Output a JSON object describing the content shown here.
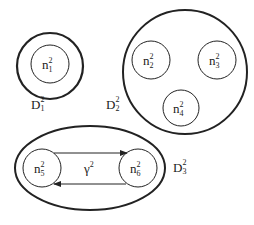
{
  "diagram": {
    "stroke_color": "#222222",
    "background": "#ffffff",
    "domains": [
      {
        "id": "D1",
        "label": {
          "base": "D",
          "sup": "2",
          "sub": "1"
        },
        "shape": "circle",
        "nodes": [
          {
            "id": "n1",
            "label": {
              "base": "n",
              "sup": "2",
              "sub": "1"
            }
          }
        ]
      },
      {
        "id": "D2",
        "label": {
          "base": "D",
          "sup": "2",
          "sub": "2"
        },
        "shape": "circle",
        "nodes": [
          {
            "id": "n2",
            "label": {
              "base": "n",
              "sup": "2",
              "sub": "2"
            }
          },
          {
            "id": "n3",
            "label": {
              "base": "n",
              "sup": "2",
              "sub": "3"
            }
          },
          {
            "id": "n4",
            "label": {
              "base": "n",
              "sup": "2",
              "sub": "4"
            }
          }
        ]
      },
      {
        "id": "D3",
        "label": {
          "base": "D",
          "sup": "2",
          "sub": "3"
        },
        "shape": "ellipse",
        "nodes": [
          {
            "id": "n5",
            "label": {
              "base": "n",
              "sup": "2",
              "sub": "5"
            }
          },
          {
            "id": "n6",
            "label": {
              "base": "n",
              "sup": "2",
              "sub": "6"
            }
          }
        ],
        "edge_label": {
          "base": "γ",
          "sup": "2"
        },
        "edges": [
          {
            "from": "n5",
            "to": "n6"
          },
          {
            "from": "n6",
            "to": "n5"
          }
        ]
      }
    ]
  }
}
